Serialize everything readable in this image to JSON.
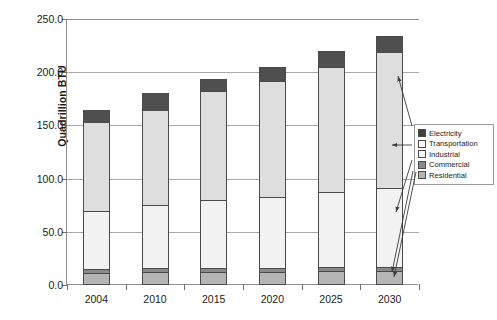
{
  "chart_data": {
    "type": "bar",
    "stacked": true,
    "title": "",
    "xlabel": "",
    "ylabel": "Quadrillion BTU",
    "categories": [
      "2004",
      "2010",
      "2015",
      "2020",
      "2025",
      "2030"
    ],
    "ylim": [
      0,
      250
    ],
    "ytick_values": [
      0,
      50,
      100,
      150,
      200,
      250
    ],
    "ytick_labels": [
      "0.0",
      "50.0",
      "100.0",
      "150.0",
      "200.0",
      "250.0"
    ],
    "grid": true,
    "grid_axis": "y",
    "legend_position": "right",
    "series": [
      {
        "name": "Residential",
        "color": "#b5b5b5",
        "values": [
          11,
          12,
          12,
          12,
          13,
          13
        ]
      },
      {
        "name": "Commercial",
        "color": "#8a8a8a",
        "values": [
          5,
          5,
          5,
          5,
          5,
          5
        ]
      },
      {
        "name": "Industrial",
        "color": "#f2f2f2",
        "values": [
          55,
          60,
          65,
          68,
          71,
          75
        ]
      },
      {
        "name": "Transportation",
        "color": "#dedede",
        "values": [
          85,
          90,
          103,
          110,
          119,
          129
        ]
      },
      {
        "name": "Electricity",
        "color": "#4f4f4f",
        "values": [
          12,
          17,
          12,
          14,
          16,
          16
        ]
      }
    ],
    "totals": [
      168,
      184,
      197,
      209,
      224,
      238
    ],
    "annotations": [
      {
        "name": "leader-line-electricity",
        "target": "2030 Electricity segment"
      },
      {
        "name": "leader-line-transportation",
        "target": "2030 Transportation segment"
      },
      {
        "name": "leader-line-industrial",
        "target": "2030 Industrial segment"
      },
      {
        "name": "leader-line-commercial",
        "target": "2030 Commercial segment"
      },
      {
        "name": "leader-line-residential",
        "target": "2030 Residential segment"
      }
    ]
  },
  "legend": {
    "entries": [
      {
        "label": "Electricity",
        "swatch": "electricity"
      },
      {
        "label": "Transportation",
        "swatch": "transportation"
      },
      {
        "label": "Industrial",
        "swatch": "industrial"
      },
      {
        "label": "Commercial",
        "swatch": "commercial"
      },
      {
        "label": "Residential",
        "swatch": "residential"
      }
    ]
  }
}
